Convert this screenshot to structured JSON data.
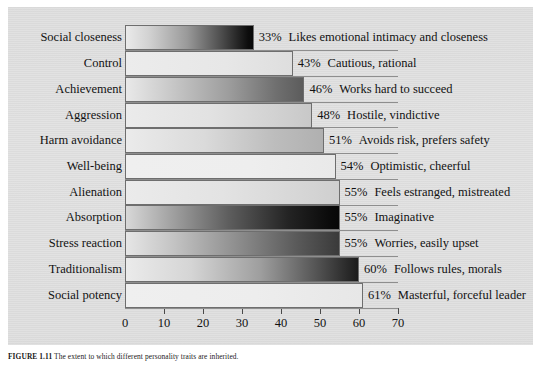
{
  "figure": {
    "caption_label": "FIGURE 1.11",
    "caption_text": "The extent to which different personality traits are inherited."
  },
  "chart_data": {
    "type": "bar",
    "orientation": "horizontal",
    "title": "",
    "xlabel": "",
    "ylabel": "",
    "xlim": [
      0,
      70
    ],
    "xticks": [
      0,
      10,
      20,
      30,
      40,
      50,
      60,
      70
    ],
    "grid": false,
    "legend": "none",
    "categories": [
      "Social closeness",
      "Control",
      "Achievement",
      "Aggression",
      "Harm avoidance",
      "Well-being",
      "Alienation",
      "Absorption",
      "Stress reaction",
      "Traditionalism",
      "Social potency"
    ],
    "values": [
      33,
      43,
      46,
      48,
      51,
      54,
      55,
      55,
      55,
      60,
      61
    ],
    "value_labels": [
      "33%",
      "43%",
      "46%",
      "48%",
      "51%",
      "54%",
      "55%",
      "55%",
      "55%",
      "60%",
      "61%"
    ],
    "descriptions": [
      "Likes emotional intimacy and closeness",
      "Cautious, rational",
      "Works hard to succeed",
      "Hostile, vindictive",
      "Avoids risk, prefers safety",
      "Optimistic, cheerful",
      "Feels estranged, mistreated",
      "Imaginative",
      "Worries, easily upset",
      "Follows rules, morals",
      "Masterful, forceful leader"
    ],
    "bar_fills": [
      "linear-gradient(90deg,#eaeaea 0%,#d2d2d2 18%,#9a9a9a 48%,#4a4a4a 76%,#0d0d0d 96%,#080808 100%)",
      "linear-gradient(90deg,#ececec 0%,#e7e7e7 60%,#dedede 100%)",
      "linear-gradient(90deg,#e9e9e9 0%,#c9c9c9 25%,#9d9d9d 58%,#6f6f6f 85%,#5c5c5c 100%)",
      "linear-gradient(90deg,#ebebeb 0%,#e2e2e2 45%,#d2d2d2 80%,#c8c8c8 100%)",
      "linear-gradient(90deg,#ebebeb 0%,#dadada 40%,#bdbdbd 75%,#b0b0b0 100%)",
      "linear-gradient(90deg,#efefef 0%,#eeeeee 60%,#e9e9e9 100%)",
      "linear-gradient(90deg,#ebebeb 0%,#e3e3e3 45%,#d6d6d6 82%,#cfcfcf 100%)",
      "linear-gradient(90deg,#d8d8d8 0%,#a5a5a5 20%,#5e5e5e 48%,#242424 76%,#0a0a0a 96%,#070707 100%)",
      "linear-gradient(90deg,#e6e6e6 0%,#c4c4c4 22%,#8e8e8e 52%,#5a5a5a 80%,#3a3a3a 100%)",
      "linear-gradient(90deg,#ebebeb 0%,#d5d5d5 28%,#9e9e9e 58%,#4e4e4e 84%,#1b1b1b 100%)",
      "linear-gradient(90deg,#efefef 0%,#ededed 55%,#e7e7e7 100%)"
    ],
    "colors": {
      "panel": "#dedede",
      "axis": "#595959",
      "bar_border": "#6e6e6e",
      "text": "#121212"
    }
  }
}
